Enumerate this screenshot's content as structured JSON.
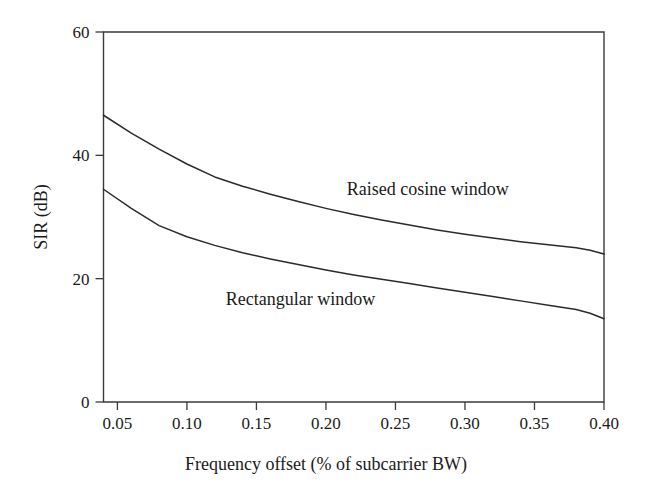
{
  "chart_data": {
    "type": "line",
    "title": "",
    "xlabel": "Frequency offset (% of subcarrier BW)",
    "ylabel": "SIR (dB)",
    "xlim": [
      0.04,
      0.4
    ],
    "ylim": [
      0,
      60
    ],
    "xticks": [
      0.05,
      0.1,
      0.15,
      0.2,
      0.25,
      0.3,
      0.35,
      0.4
    ],
    "xticklabels": [
      "0.05",
      "0.10",
      "0.15",
      "0.20",
      "0.25",
      "0.30",
      "0.35",
      "0.40"
    ],
    "yticks": [
      0,
      20,
      40,
      60
    ],
    "yticklabels": [
      "0",
      "20",
      "40",
      "60"
    ],
    "grid": false,
    "legend_position": "inline-annotations",
    "series": [
      {
        "name": "Raised cosine window",
        "x": [
          0.04,
          0.06,
          0.08,
          0.1,
          0.12,
          0.14,
          0.16,
          0.18,
          0.2,
          0.22,
          0.24,
          0.26,
          0.28,
          0.3,
          0.32,
          0.34,
          0.36,
          0.38,
          0.39,
          0.4
        ],
        "y": [
          46.5,
          43.6,
          41.0,
          38.6,
          36.5,
          35.0,
          33.7,
          32.5,
          31.4,
          30.4,
          29.5,
          28.7,
          27.9,
          27.2,
          26.6,
          26.0,
          25.5,
          25.0,
          24.6,
          24.0
        ]
      },
      {
        "name": "Rectangular window",
        "x": [
          0.04,
          0.06,
          0.08,
          0.1,
          0.12,
          0.14,
          0.16,
          0.18,
          0.2,
          0.22,
          0.24,
          0.26,
          0.28,
          0.3,
          0.32,
          0.34,
          0.36,
          0.38,
          0.39,
          0.4
        ],
        "y": [
          34.5,
          31.4,
          28.6,
          26.8,
          25.4,
          24.2,
          23.2,
          22.3,
          21.4,
          20.6,
          19.9,
          19.2,
          18.5,
          17.8,
          17.1,
          16.4,
          15.7,
          15.0,
          14.4,
          13.5
        ]
      }
    ],
    "annotations": [
      {
        "text": "Raised cosine window",
        "x": 0.215,
        "y": 33.5
      },
      {
        "text": "Rectangular window",
        "x": 0.128,
        "y": 15.8
      }
    ]
  },
  "colors": {
    "axis": "#3b3b3b",
    "line": "#2b2b2b",
    "text": "#1a1a1a",
    "background": "#ffffff"
  }
}
